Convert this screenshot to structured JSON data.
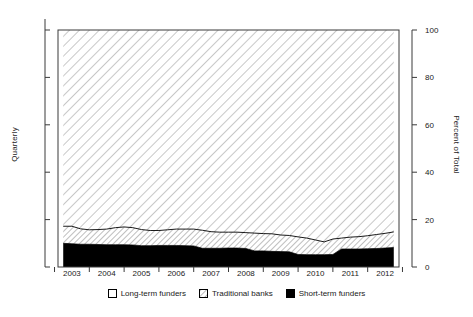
{
  "chart_data": {
    "type": "area",
    "subtype": "stacked-percentage-area",
    "title": "",
    "xlabel": "",
    "ylabel": "Quarterly",
    "ylabel_right": "Percent of Total",
    "ylim": [
      0,
      100
    ],
    "xlim": [
      2002.6,
      2012.4
    ],
    "grid": false,
    "legend_position": "bottom",
    "ytick_labels": [
      "0",
      "20",
      "40",
      "60",
      "80",
      "100"
    ],
    "ytick_values": [
      0,
      20,
      40,
      60,
      80,
      100
    ],
    "xtick_labels": [
      "2003",
      "2004",
      "2005",
      "2006",
      "2007",
      "2008",
      "2009",
      "2010",
      "2011",
      "2012"
    ],
    "xtick_values": [
      2003,
      2004,
      2005,
      2006,
      2007,
      2008,
      2009,
      2010,
      2011,
      2012
    ],
    "x": [
      2002.75,
      2003.0,
      2003.25,
      2003.5,
      2003.75,
      2004.0,
      2004.25,
      2004.5,
      2004.75,
      2005.0,
      2005.25,
      2005.5,
      2005.75,
      2006.0,
      2006.25,
      2006.5,
      2006.75,
      2007.0,
      2007.25,
      2007.5,
      2007.75,
      2008.0,
      2008.25,
      2008.5,
      2008.75,
      2009.0,
      2009.25,
      2009.5,
      2009.75,
      2010.0,
      2010.25,
      2010.5,
      2010.75,
      2011.0,
      2011.25,
      2011.5,
      2011.75,
      2012.0,
      2012.25
    ],
    "series": [
      {
        "name": "Short-term funders",
        "fill": "solid-black",
        "color": "#000000",
        "values": [
          10.0,
          9.8,
          9.6,
          9.6,
          9.5,
          9.4,
          9.4,
          9.4,
          9.3,
          9.0,
          9.0,
          9.1,
          9.1,
          9.1,
          9.0,
          8.9,
          7.9,
          7.9,
          7.9,
          8.0,
          8.0,
          7.8,
          6.8,
          6.8,
          6.6,
          6.5,
          6.4,
          5.3,
          5.2,
          5.2,
          5.2,
          5.3,
          7.6,
          7.6,
          7.6,
          7.7,
          7.8,
          8.0,
          8.2
        ]
      },
      {
        "name": "Traditional banks",
        "fill": "diagonal-hatch-fine",
        "color": "#ffffff",
        "values": [
          7.2,
          7.4,
          6.5,
          6.1,
          6.3,
          6.6,
          7.2,
          7.5,
          7.3,
          6.8,
          6.4,
          6.3,
          6.6,
          6.9,
          7.0,
          7.1,
          7.6,
          7.0,
          6.8,
          6.7,
          6.7,
          6.7,
          7.5,
          7.3,
          7.4,
          7.0,
          6.9,
          7.4,
          7.0,
          6.2,
          5.4,
          6.5,
          4.6,
          5.0,
          5.2,
          5.5,
          5.9,
          6.2,
          6.6
        ]
      },
      {
        "name": "Long-term funders",
        "fill": "diagonal-hatch-coarse",
        "color": "#ffffff",
        "values": [
          82.8,
          82.8,
          83.9,
          84.3,
          84.2,
          84.0,
          83.4,
          83.1,
          83.4,
          84.2,
          84.6,
          84.6,
          84.3,
          84.0,
          84.0,
          84.0,
          84.5,
          85.1,
          85.3,
          85.3,
          85.3,
          85.5,
          85.7,
          85.9,
          86.0,
          86.5,
          86.7,
          87.3,
          87.8,
          88.6,
          89.4,
          88.2,
          87.8,
          87.4,
          87.2,
          86.8,
          86.3,
          85.8,
          85.2
        ]
      }
    ]
  },
  "legend": {
    "items": [
      {
        "label": "Long-term funders",
        "swatch": "white-box"
      },
      {
        "label": "Traditional banks",
        "swatch": "hatched-box"
      },
      {
        "label": "Short-term funders",
        "swatch": "black-box"
      }
    ]
  }
}
